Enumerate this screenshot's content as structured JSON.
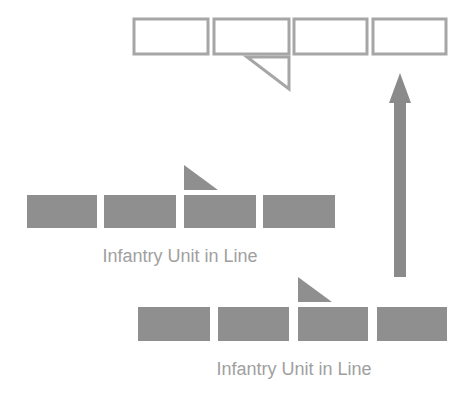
{
  "diagram": {
    "colors": {
      "background": "#ffffff",
      "unit_fill": "#8f8f8f",
      "outline_stroke": "#a6a6a6",
      "arrow": "#8a8a8a",
      "label_text": "#a0a0a0"
    },
    "formations": [
      {
        "id": "target-line",
        "style": "outline",
        "blocks": [
          {
            "x": 134,
            "y": 19,
            "w": 74,
            "h": 35
          },
          {
            "x": 214,
            "y": 19,
            "w": 75,
            "h": 35
          },
          {
            "x": 294,
            "y": 19,
            "w": 73,
            "h": 35
          },
          {
            "x": 373,
            "y": 19,
            "w": 73,
            "h": 35
          }
        ],
        "marker": {
          "points": "247,57 289,57 289,89",
          "style": "outline"
        }
      },
      {
        "id": "infantry-line-1",
        "style": "filled",
        "blocks": [
          {
            "x": 27,
            "y": 195,
            "w": 70,
            "h": 33
          },
          {
            "x": 104,
            "y": 195,
            "w": 72,
            "h": 33
          },
          {
            "x": 184,
            "y": 195,
            "w": 72,
            "h": 33
          },
          {
            "x": 263,
            "y": 195,
            "w": 72,
            "h": 33
          }
        ],
        "marker": {
          "points": "184,165 184,190 218,190",
          "style": "filled"
        },
        "label": {
          "text": "Infantry Unit in Line",
          "x": 180,
          "y": 262
        }
      },
      {
        "id": "infantry-line-2",
        "style": "filled",
        "blocks": [
          {
            "x": 138,
            "y": 307,
            "w": 72,
            "h": 34
          },
          {
            "x": 218,
            "y": 307,
            "w": 71,
            "h": 34
          },
          {
            "x": 298,
            "y": 307,
            "w": 70,
            "h": 34
          },
          {
            "x": 377,
            "y": 307,
            "w": 70,
            "h": 34
          }
        ],
        "marker": {
          "points": "298,277 298,302 332,302",
          "style": "filled"
        },
        "label": {
          "text": "Infantry Unit in Line",
          "x": 294,
          "y": 375
        }
      }
    ],
    "arrow": {
      "direction": "up",
      "shaft": {
        "x": 394,
        "y": 102,
        "w": 12,
        "h": 175
      },
      "head": "389,103 400,73 411,103"
    }
  }
}
